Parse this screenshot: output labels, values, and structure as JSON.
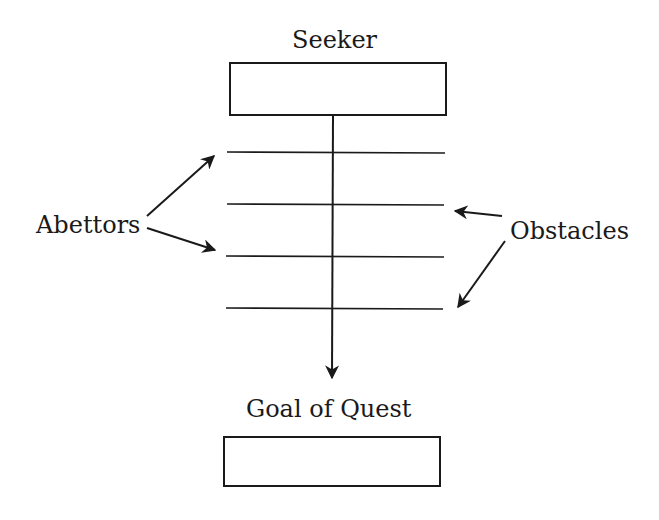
{
  "diagram": {
    "nodes": {
      "seeker": {
        "label": "Seeker"
      },
      "goal": {
        "label": "Goal of Quest"
      },
      "abettors": {
        "label": "Abettors"
      },
      "obstacles": {
        "label": "Obstacles"
      }
    },
    "crossbars": 4,
    "edges": [
      {
        "from": "Seeker",
        "to": "Goal of Quest",
        "type": "arrow"
      },
      {
        "from": "Abettors",
        "to": "crossbar-1",
        "type": "arrow"
      },
      {
        "from": "Abettors",
        "to": "crossbar-3",
        "type": "arrow"
      },
      {
        "from": "Obstacles",
        "to": "crossbar-2",
        "type": "arrow"
      },
      {
        "from": "Obstacles",
        "to": "crossbar-4",
        "type": "arrow"
      }
    ],
    "colors": {
      "stroke": "#1a1a1a",
      "background": "#ffffff"
    }
  }
}
